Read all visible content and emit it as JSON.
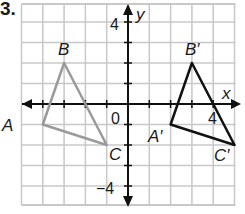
{
  "problem": {
    "number": "3."
  },
  "axes": {
    "x_label": "x",
    "y_label": "y",
    "origin_label": "0",
    "y_tick_pos_label": "4",
    "y_tick_neg_label": "−4",
    "x_tick_pos_label": "4",
    "x_range": [
      -5,
      5
    ],
    "y_range": [
      -5,
      4
    ]
  },
  "colors": {
    "grid": "#c8c8c8",
    "axis": "#111111",
    "preimage": "#9a9a9a",
    "image": "#111111",
    "text": "#1a1a1a"
  },
  "preimage": {
    "name": "triangle ABC",
    "vertices": [
      {
        "label": "A",
        "x": -4,
        "y": -1
      },
      {
        "label": "B",
        "x": -3,
        "y": 2
      },
      {
        "label": "C",
        "x": -1,
        "y": -2
      }
    ]
  },
  "image": {
    "name": "triangle A'B'C'",
    "vertices": [
      {
        "label": "A′",
        "x": 2,
        "y": -1
      },
      {
        "label": "B′",
        "x": 3,
        "y": 2
      },
      {
        "label": "C′",
        "x": 5,
        "y": -2
      }
    ]
  }
}
